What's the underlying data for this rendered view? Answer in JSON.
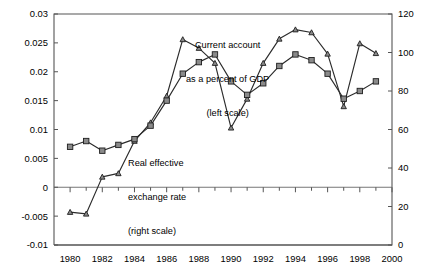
{
  "chart_data": {
    "type": "line",
    "title": "",
    "subtitle": "",
    "xlabel": "",
    "ylabel": "",
    "y2label": "",
    "x": [
      1980,
      1981,
      1982,
      1983,
      1984,
      1985,
      1986,
      1987,
      1988,
      1989,
      1990,
      1991,
      1992,
      1993,
      1994,
      1995,
      1996,
      1997,
      1998,
      1999
    ],
    "xlim": [
      1979,
      2000
    ],
    "xticks": [
      1980,
      1982,
      1984,
      1986,
      1988,
      1990,
      1992,
      1994,
      1996,
      1998,
      2000
    ],
    "xtick_labels": [
      "1980",
      "1982",
      "1984",
      "1986",
      "1988",
      "1990",
      "1992",
      "1994",
      "1996",
      "1998",
      "2000"
    ],
    "xminorticks": [
      1981,
      1983,
      1985,
      1987,
      1989,
      1991,
      1993,
      1995,
      1997,
      1999
    ],
    "ylim": [
      -0.01,
      0.03
    ],
    "yticks": [
      -0.01,
      -0.005,
      0,
      0.005,
      0.01,
      0.015,
      0.02,
      0.025,
      0.03
    ],
    "ytick_labels": [
      "-0.01",
      "-0.005",
      "0",
      "0.005",
      "0.01",
      "0.015",
      "0.02",
      "0.025",
      "0.03"
    ],
    "y2lim": [
      0,
      120
    ],
    "y2ticks": [
      0,
      20,
      40,
      60,
      80,
      100,
      120
    ],
    "y2tick_labels": [
      "0",
      "20",
      "40",
      "60",
      "80",
      "100",
      "120"
    ],
    "grid": false,
    "legend_position": "inline-annotations",
    "series": [
      {
        "name": "Current account as a percent of GDP",
        "axis": "left",
        "marker": "triangle",
        "values": [
          -0.0043,
          -0.0046,
          0.0018,
          0.0024,
          0.008,
          0.0112,
          0.0158,
          0.0256,
          0.0241,
          0.0215,
          0.0103,
          0.0153,
          0.0215,
          0.0257,
          0.0273,
          0.0268,
          0.0231,
          0.014,
          0.0249,
          0.0232
        ]
      },
      {
        "name": "Real effective exchange rate",
        "axis": "right",
        "marker": "square",
        "values": [
          51,
          54,
          49,
          52,
          55,
          62,
          75,
          89,
          95,
          99,
          85,
          78,
          84,
          93,
          99,
          96,
          89,
          76,
          80,
          85
        ]
      }
    ],
    "annotations": [
      {
        "id": "current-account",
        "lines": [
          "Current account",
          "as a percent of GDP",
          "(left scale)"
        ],
        "target_series": "Current account as a percent of GDP"
      },
      {
        "id": "real-effective-exchange-rate",
        "lines": [
          "Real effective",
          "exchange rate",
          "(right scale)"
        ],
        "target_series": "Real effective exchange rate"
      }
    ],
    "colors": {
      "line": "#2b2b2b",
      "marker_fill": "#8a8a8a",
      "marker_stroke": "#1d1d1d",
      "axis": "#555555",
      "background": "#ffffff",
      "text": "#000000"
    }
  },
  "annotation_current": {
    "line1": "Current account",
    "line2": "as a percent of GDP",
    "line3": "(left scale)"
  },
  "annotation_reer": {
    "line1": "Real effective",
    "line2": "exchange rate",
    "line3": "(right scale)"
  }
}
